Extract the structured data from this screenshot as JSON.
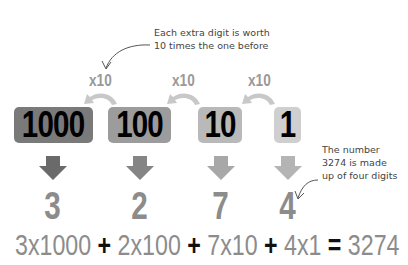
{
  "annotations": {
    "top_note": {
      "line1": "Each extra digit is worth",
      "line2": "10 times the one before"
    },
    "side_note": {
      "line1": "The number",
      "line2": "3274 is made",
      "line3": "up of four digits"
    }
  },
  "multipliers": [
    {
      "label": "x10"
    },
    {
      "label": "x10"
    },
    {
      "label": "x10"
    }
  ],
  "place_values": [
    {
      "label": "1000",
      "color": "#7a7a7a"
    },
    {
      "label": "100",
      "color": "#9c9c9c"
    },
    {
      "label": "10",
      "color": "#b9b9b9"
    },
    {
      "label": "1",
      "color": "#cfcfcf"
    }
  ],
  "down_arrows": [
    {
      "color": "#6a6a6a"
    },
    {
      "color": "#858585"
    },
    {
      "color": "#a8a8a8"
    },
    {
      "color": "#b4b4b4"
    }
  ],
  "digits": [
    {
      "value": "3"
    },
    {
      "value": "2"
    },
    {
      "value": "7"
    },
    {
      "value": "4"
    }
  ],
  "equation": {
    "term1": "3x1000",
    "op1": "+",
    "term2": "2x100",
    "op2": "+",
    "term3": "7x10",
    "op3": "+",
    "term4": "4x1",
    "eq": "=",
    "result": "3274"
  },
  "colors": {
    "curve_arrow": "#c8c8c8",
    "pointer_line": "#555555",
    "digit_text": "#8c8c8c"
  }
}
